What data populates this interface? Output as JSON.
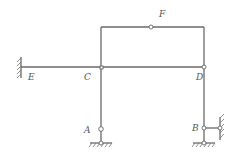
{
  "diagram": {
    "type": "structural frame",
    "labels": {
      "E": "E",
      "C": "C",
      "D": "D",
      "F": "F",
      "A": "A",
      "B": "B"
    },
    "nodes": [
      {
        "id": "E",
        "support": "fixed wall (left)"
      },
      {
        "id": "C",
        "joint": "rigid joint with small hinge marker"
      },
      {
        "id": "D",
        "joint": "hinge"
      },
      {
        "id": "F",
        "joint": "hinge in top beam"
      },
      {
        "id": "A",
        "joint": "hinge above pinned support"
      },
      {
        "id": "B",
        "joint": "hinge with horizontal link to right wall and pinned support below"
      }
    ],
    "members": [
      "E-C",
      "C-D",
      "C-top-left",
      "top-left-F",
      "F-top-right",
      "top-right-D",
      "C-A",
      "D-B",
      "B-wall link"
    ],
    "colors": {
      "line": "#6a6a6a",
      "background": "#ffffff"
    }
  }
}
